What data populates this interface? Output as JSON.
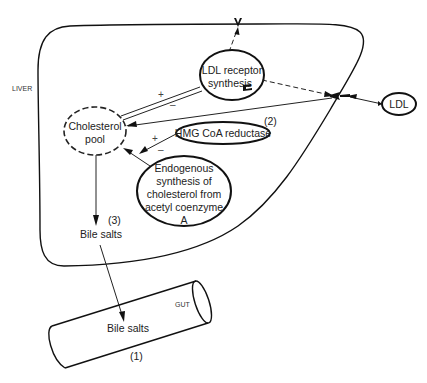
{
  "diagram": {
    "regions": {
      "liver": "LIVER",
      "gut": "GUT"
    },
    "nodes": {
      "ldl_receptor_line1": "LDL receptor",
      "ldl_receptor_line2": "synthesis",
      "cholesterol_pool_line1": "Cholesterol",
      "cholesterol_pool_line2": "pool",
      "hmg_coa": "HMG CoA reductase",
      "endogenous_line1": "Endogenous",
      "endogenous_line2": "synthesis of",
      "endogenous_line3": "cholesterol from",
      "endogenous_line4": "acetyl coenzyme",
      "endogenous_line5": "A",
      "ldl": "LDL",
      "bile_salts_liver": "Bile salts",
      "bile_salts_gut": "Bile salts"
    },
    "annotations": {
      "step1": "(1)",
      "step2": "(2)",
      "step3": "(3)",
      "plus_receptor": "+",
      "minus_receptor": "–",
      "plus_hmg": "+",
      "minus_hmg": "–"
    },
    "colors": {
      "stroke": "#111111",
      "text": "#222222",
      "background": "#ffffff"
    }
  }
}
